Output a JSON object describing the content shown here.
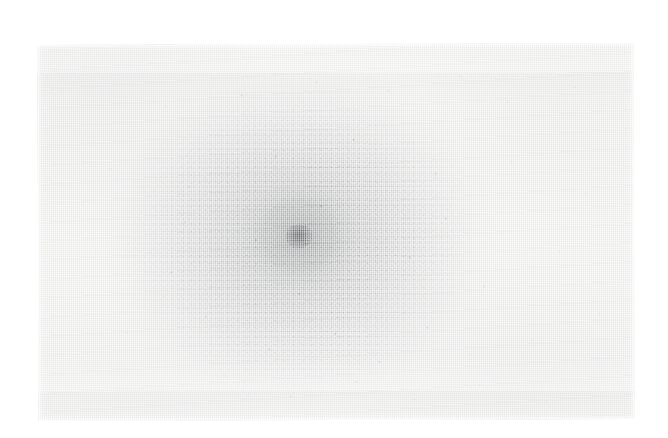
{
  "image": {
    "kind": "scanned-photograph",
    "subject": "diffuse circular stain with dense dark central core on woven paper",
    "title": "",
    "caption": "",
    "background_color": "#ffffff",
    "plate": {
      "x": 38,
      "y": 44,
      "width": 596,
      "height": 376,
      "rotation_deg": -0.18,
      "paper_color": "#f3f3f1",
      "edge_color": "#ededeb"
    },
    "halo": {
      "center_x": 320,
      "center_y": 236,
      "radius_x": 150,
      "radius_y": 138,
      "peak_color": "#787a7c",
      "peak_opacity": 0.42,
      "fade_to": "#ffffff"
    },
    "inner_cloud": {
      "center_x": 321,
      "center_y": 235,
      "radius_x": 52,
      "radius_y": 46,
      "color": "#606264",
      "opacity": 0.34
    },
    "core": {
      "center_x": 319,
      "center_y": 236,
      "width": 30,
      "height": 28,
      "color": "#4a4c4e",
      "opacity": 0.88,
      "grain_color": "#282a2c"
    },
    "ring": {
      "center_x": 320,
      "center_y": 235,
      "diameter": 74,
      "color": "#787a7c",
      "opacity": 0.12
    },
    "texture": {
      "type": "halftone-scan-ruling",
      "vertical_line_pitch_px": 2.0,
      "horizontal_line_pitch_px": 1.9,
      "highlight_color": "#ffffff",
      "line_color": "#c4c6c8",
      "speckle_color": "#60626 4"
    },
    "dust_specks": [
      {
        "x": 128,
        "y": 62,
        "r": 0.9
      },
      {
        "x": 204,
        "y": 51,
        "r": 0.8
      },
      {
        "x": 279,
        "y": 38,
        "r": 1.0
      },
      {
        "x": 351,
        "y": 47,
        "r": 0.8
      },
      {
        "x": 423,
        "y": 33,
        "r": 0.9
      },
      {
        "x": 470,
        "y": 58,
        "r": 0.8
      },
      {
        "x": 537,
        "y": 44,
        "r": 0.9
      },
      {
        "x": 72,
        "y": 124,
        "r": 0.8
      },
      {
        "x": 151,
        "y": 142,
        "r": 1.1
      },
      {
        "x": 238,
        "y": 112,
        "r": 0.9
      },
      {
        "x": 316,
        "y": 96,
        "r": 0.8
      },
      {
        "x": 398,
        "y": 130,
        "r": 1.0
      },
      {
        "x": 474,
        "y": 118,
        "r": 0.8
      },
      {
        "x": 548,
        "y": 151,
        "r": 0.9
      },
      {
        "x": 58,
        "y": 206,
        "r": 0.9
      },
      {
        "x": 133,
        "y": 228,
        "r": 1.0
      },
      {
        "x": 218,
        "y": 196,
        "r": 0.8
      },
      {
        "x": 261,
        "y": 250,
        "r": 1.1
      },
      {
        "x": 372,
        "y": 214,
        "r": 0.9
      },
      {
        "x": 446,
        "y": 243,
        "r": 0.8
      },
      {
        "x": 521,
        "y": 208,
        "r": 0.9
      },
      {
        "x": 89,
        "y": 288,
        "r": 0.8
      },
      {
        "x": 168,
        "y": 272,
        "r": 1.0
      },
      {
        "x": 231,
        "y": 305,
        "r": 1.2
      },
      {
        "x": 297,
        "y": 290,
        "r": 1.1
      },
      {
        "x": 341,
        "y": 318,
        "r": 1.0
      },
      {
        "x": 389,
        "y": 284,
        "r": 0.9
      },
      {
        "x": 432,
        "y": 311,
        "r": 1.1
      },
      {
        "x": 494,
        "y": 296,
        "r": 0.8
      },
      {
        "x": 561,
        "y": 271,
        "r": 0.9
      },
      {
        "x": 104,
        "y": 344,
        "r": 0.9
      },
      {
        "x": 186,
        "y": 332,
        "r": 1.0
      },
      {
        "x": 252,
        "y": 352,
        "r": 0.9
      },
      {
        "x": 318,
        "y": 338,
        "r": 0.8
      },
      {
        "x": 376,
        "y": 356,
        "r": 1.0
      },
      {
        "x": 441,
        "y": 341,
        "r": 0.9
      },
      {
        "x": 508,
        "y": 358,
        "r": 0.8
      },
      {
        "x": 147,
        "y": 178,
        "r": 0.8
      },
      {
        "x": 283,
        "y": 162,
        "r": 0.9
      },
      {
        "x": 408,
        "y": 175,
        "r": 0.8
      }
    ]
  }
}
